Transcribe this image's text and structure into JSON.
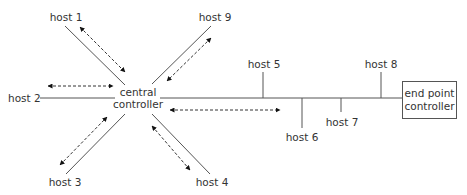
{
  "diagram": {
    "type": "network-topology",
    "central": {
      "line1": "central",
      "line2": "controller"
    },
    "end_point": {
      "line1": "end point",
      "line2": "controller"
    },
    "star_hosts": [
      {
        "id": "host1",
        "label": "host 1"
      },
      {
        "id": "host2",
        "label": "host 2"
      },
      {
        "id": "host3",
        "label": "host 3"
      },
      {
        "id": "host4",
        "label": "host 4"
      },
      {
        "id": "host9",
        "label": "host 9"
      }
    ],
    "bus_hosts": [
      {
        "id": "host5",
        "label": "host 5",
        "side": "above"
      },
      {
        "id": "host6",
        "label": "host 6",
        "side": "below"
      },
      {
        "id": "host7",
        "label": "host 7",
        "side": "below"
      },
      {
        "id": "host8",
        "label": "host 8",
        "side": "above"
      }
    ],
    "edges": [
      {
        "from": "central controller",
        "to": "host 1",
        "style": "solid",
        "bidirectional_dashed_arrow": true
      },
      {
        "from": "central controller",
        "to": "host 2",
        "style": "solid",
        "bidirectional_dashed_arrow": true
      },
      {
        "from": "central controller",
        "to": "host 3",
        "style": "solid",
        "bidirectional_dashed_arrow": true
      },
      {
        "from": "central controller",
        "to": "host 4",
        "style": "solid",
        "bidirectional_dashed_arrow": true
      },
      {
        "from": "central controller",
        "to": "host 9",
        "style": "solid",
        "bidirectional_dashed_arrow": true
      },
      {
        "from": "central controller",
        "to": "end point controller",
        "style": "solid bus",
        "bidirectional_dashed_arrow": true
      }
    ],
    "colors": {
      "line": "#555555",
      "text": "#333333",
      "arrow": "#111111"
    }
  }
}
